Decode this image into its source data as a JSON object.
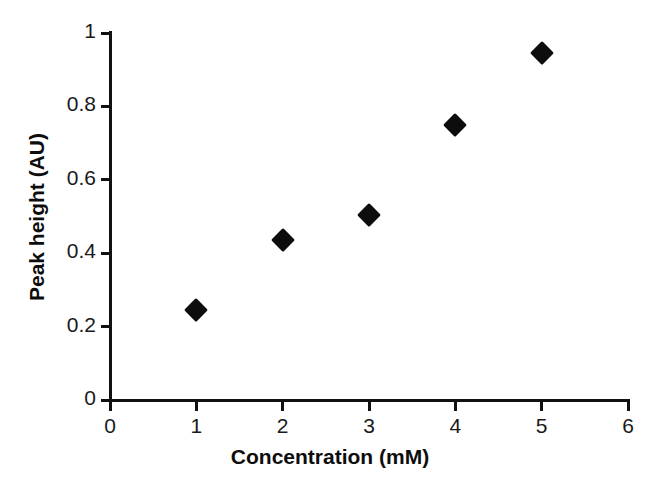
{
  "chart_data": {
    "type": "scatter",
    "title": "",
    "xlabel": "Concentration (mM)",
    "ylabel": "Peak height (AU)",
    "xlim": [
      0,
      6
    ],
    "ylim": [
      0,
      1
    ],
    "xticks": [
      "0",
      "1",
      "2",
      "3",
      "4",
      "5",
      "6"
    ],
    "xtick_values": [
      0,
      1,
      2,
      3,
      4,
      5,
      6
    ],
    "yticks": [
      "0",
      "0.2",
      "0.4",
      "0.6",
      "0.8",
      "1"
    ],
    "ytick_values": [
      0,
      0.2,
      0.4,
      0.6,
      0.8,
      1
    ],
    "grid": false,
    "legend": null,
    "marker": "filled-diamond",
    "marker_color": "#0d0d0d",
    "background_color": "#ffffff",
    "axis_color": "#111111",
    "series": [
      {
        "name": "Peak height",
        "x": [
          1,
          2,
          3,
          4,
          5
        ],
        "y": [
          0.245,
          0.435,
          0.505,
          0.75,
          0.945
        ],
        "points": [
          {
            "x": 1,
            "y": 0.245
          },
          {
            "x": 2,
            "y": 0.435
          },
          {
            "x": 3,
            "y": 0.505
          },
          {
            "x": 4,
            "y": 0.75
          },
          {
            "x": 5,
            "y": 0.945
          }
        ]
      }
    ]
  }
}
